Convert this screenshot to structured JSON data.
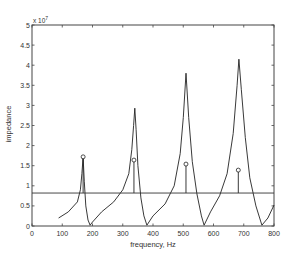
{
  "chart_data": {
    "type": "line",
    "title": "",
    "xlabel": "frequency, Hz",
    "ylabel": "impedance",
    "y_exponent_label": "x 10",
    "y_exponent_power": "7",
    "xlim": [
      0,
      800
    ],
    "ylim": [
      0,
      5
    ],
    "y_scale_factor": 10000000,
    "grid": false,
    "legend": null,
    "x_ticks": [
      0,
      100,
      200,
      300,
      400,
      500,
      600,
      700,
      800
    ],
    "y_ticks": [
      0,
      0.5,
      1,
      1.5,
      2,
      2.5,
      3,
      3.5,
      4,
      4.5,
      5
    ],
    "y_tick_labels": [
      "0",
      "0.5",
      "1",
      "1.5",
      "2",
      "2.5",
      "3",
      "3.5",
      "4",
      "4.5",
      "5"
    ],
    "series": [
      {
        "name": "impedance curve",
        "style": "line",
        "x": [
          88,
          120,
          150,
          160,
          165,
          169,
          173,
          178,
          185,
          192,
          200,
          230,
          270,
          300,
          320,
          330,
          336,
          340,
          344,
          350,
          360,
          370,
          380,
          400,
          440,
          470,
          490,
          500,
          509,
          518,
          530,
          545,
          560,
          569,
          590,
          620,
          645,
          665,
          678,
          684,
          692,
          705,
          720,
          740,
          760,
          780,
          800
        ],
        "y": [
          0.2,
          0.35,
          0.6,
          0.9,
          1.3,
          1.72,
          1.1,
          0.5,
          0.15,
          0.02,
          0.1,
          0.35,
          0.6,
          0.9,
          1.3,
          1.9,
          2.5,
          2.93,
          2.4,
          1.5,
          0.7,
          0.25,
          0.02,
          0.25,
          0.55,
          1.0,
          1.8,
          2.7,
          3.8,
          2.7,
          1.6,
          0.8,
          0.25,
          0.02,
          0.35,
          0.75,
          1.3,
          2.3,
          3.5,
          4.15,
          3.4,
          2.2,
          1.2,
          0.5,
          0.02,
          0.2,
          0.52
        ]
      },
      {
        "name": "resonance stems",
        "style": "stem",
        "base": 0.82,
        "x": [
          169,
          337,
          509,
          682
        ],
        "y": [
          1.72,
          1.64,
          1.54,
          1.39
        ]
      },
      {
        "name": "threshold line",
        "style": "hline",
        "y": 0.82
      }
    ]
  }
}
